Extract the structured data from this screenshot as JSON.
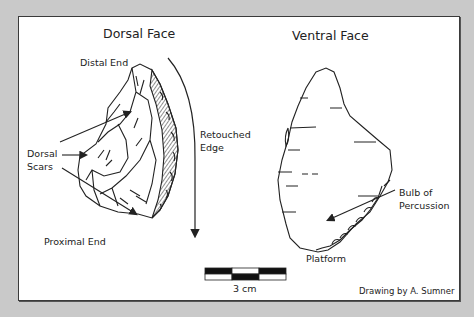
{
  "diagram": {
    "dorsal": {
      "title": "Dorsal Face",
      "labels": {
        "distal_end": "Distal End",
        "retouched_edge_line1": "Retouched",
        "retouched_edge_line2": "Edge",
        "dorsal_scars_line1": "Dorsal",
        "dorsal_scars_line2": "Scars",
        "proximal_end": "Proximal End"
      }
    },
    "ventral": {
      "title": "Ventral Face",
      "labels": {
        "bulb_line1": "Bulb of",
        "bulb_line2": "Percussion",
        "platform": "Platform"
      }
    },
    "scale_bar": {
      "label": "3 cm",
      "segments": 3
    },
    "credit": "Drawing by A. Sumner",
    "colors": {
      "background": "#c9c9c9",
      "panel": "#ffffff",
      "ink": "#222222"
    }
  }
}
